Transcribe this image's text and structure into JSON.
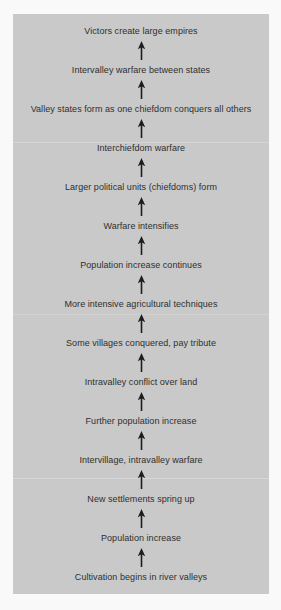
{
  "figure": {
    "type": "flowchart",
    "orientation": "bottom-to-top",
    "panel_background": "#c9c9c9",
    "page_background": "#f9f9f9",
    "text_color": "#2f2f2f",
    "arrow_color": "#1d1d1d",
    "arrow_icon_name": "arrow-up-icon",
    "steps": [
      {
        "order": 14,
        "label": "Victors create large empires"
      },
      {
        "order": 13,
        "label": "Intervalley warfare between states"
      },
      {
        "order": 12,
        "label": "Valley states form as one chiefdom conquers all others"
      },
      {
        "order": 11,
        "label": "Interchiefdom warfare"
      },
      {
        "order": 10,
        "label": "Larger political units (chiefdoms) form"
      },
      {
        "order": 9,
        "label": "Warfare intensifies"
      },
      {
        "order": 8,
        "label": "Population increase continues"
      },
      {
        "order": 7,
        "label": "More intensive agricultural techniques"
      },
      {
        "order": 6,
        "label": "Some villages conquered, pay tribute"
      },
      {
        "order": 5,
        "label": "Intravalley conflict over land"
      },
      {
        "order": 4,
        "label": "Further population increase"
      },
      {
        "order": 3,
        "label": "Intervillage, intravalley warfare"
      },
      {
        "order": 2,
        "label": "New settlements spring up"
      },
      {
        "order": 1,
        "label": "Population increase"
      },
      {
        "order": 0,
        "label": "Cultivation begins in river valleys"
      }
    ]
  }
}
